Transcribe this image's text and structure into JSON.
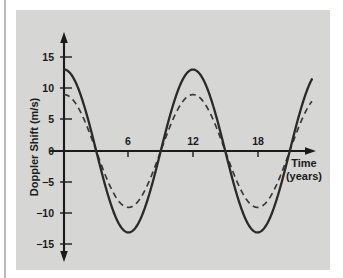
{
  "figure": {
    "panel_background": "#d6d6d4",
    "page_background": "#ffffff"
  },
  "chart_data": {
    "type": "line",
    "title": "",
    "xlabel": "Time",
    "xlabel_unit": "(years)",
    "ylabel": "Doppler Shift (m/s)",
    "xlim": [
      0,
      25
    ],
    "ylim": [
      -17,
      17
    ],
    "xticks": [
      6,
      12,
      18
    ],
    "xtick_labels": [
      "6",
      "12",
      "18"
    ],
    "yticks": [
      15,
      10,
      5,
      0,
      -5,
      -10,
      -15
    ],
    "ytick_labels": [
      "15",
      "10",
      "5",
      "0",
      "−5",
      "−10",
      "−15"
    ],
    "grid": false,
    "legend": "none",
    "x_axis_arrow": true,
    "y_axis_arrow": true,
    "series": [
      {
        "name": "solid-curve",
        "style": "solid",
        "color": "#2a2a2a",
        "amplitude": 13,
        "period": 12,
        "phase_years": 0,
        "waveform": "cosine",
        "x": [
          0,
          1,
          2,
          3,
          4,
          5,
          6,
          7,
          8,
          9,
          10,
          11,
          12,
          13,
          14,
          15,
          16,
          17,
          18,
          19,
          20,
          21,
          22,
          23,
          24,
          25
        ],
        "values": [
          13.0,
          12.2,
          10.0,
          6.5,
          2.3,
          -2.3,
          -6.5,
          -10.0,
          -12.2,
          -13.0,
          -12.2,
          -10.0,
          -6.5,
          -2.3,
          2.3,
          6.5,
          10.0,
          12.2,
          13.0,
          12.2,
          10.0,
          6.5,
          2.3,
          -2.3,
          -6.5,
          -10.0
        ]
      },
      {
        "name": "dashed-curve",
        "style": "dashed",
        "color": "#3a3a3a",
        "amplitude": 9,
        "period": 12,
        "phase_years": 0,
        "waveform": "cosine",
        "x": [
          0,
          1,
          2,
          3,
          4,
          5,
          6,
          7,
          8,
          9,
          10,
          11,
          12,
          13,
          14,
          15,
          16,
          17,
          18,
          19,
          20,
          21,
          22,
          23,
          24,
          25
        ],
        "values": [
          9.0,
          8.5,
          6.9,
          4.5,
          1.6,
          -1.6,
          -4.5,
          -6.9,
          -8.5,
          -9.0,
          -8.5,
          -6.9,
          -4.5,
          -1.6,
          1.6,
          4.5,
          6.9,
          8.5,
          9.0,
          8.5,
          6.9,
          4.5,
          1.6,
          -1.6,
          -4.5,
          -6.9
        ]
      }
    ]
  }
}
